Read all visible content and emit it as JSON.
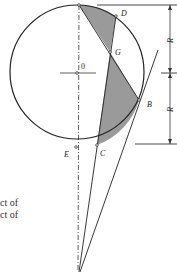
{
  "figure": {
    "points": {
      "D": "D",
      "G": "G",
      "O": "0",
      "B": "B",
      "C": "C",
      "E": "E"
    },
    "dimension_labels": {
      "upper": "R",
      "lower": "R"
    },
    "colors": {
      "shading": "#9a9a9a",
      "line": "#222222",
      "background": "#ffffff"
    }
  },
  "text_fragments": [
    "ct of",
    "ct of"
  ]
}
